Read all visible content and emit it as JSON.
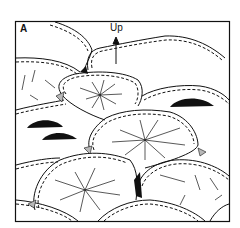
{
  "figure": {
    "panel_label": "A",
    "arrow_label": "Up",
    "colors": {
      "background": "#ffffff",
      "ink": "#111111",
      "interstitial": "#b8b8b8",
      "fill_black": "#111111"
    }
  }
}
